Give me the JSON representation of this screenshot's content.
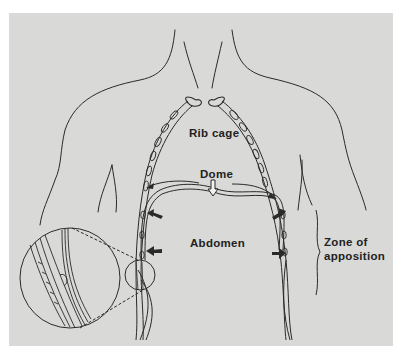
{
  "figure": {
    "background": "#d9d9d7",
    "ink": "#2a2a2a",
    "labels": {
      "rib_cage": "Rib cage",
      "dome": "Dome",
      "abdomen": "Abdomen",
      "zone_line1": "Zone of",
      "zone_line2": "apposition"
    },
    "elements": [
      {
        "name": "torso-outline",
        "description": "neck, shoulders and trunk outline"
      },
      {
        "name": "rib-cage",
        "description": "costal cartilage chains forming rib cage"
      },
      {
        "name": "diaphragm-dome",
        "description": "diaphragm muscle dome with downward hollow arrow"
      },
      {
        "name": "inward-arrows",
        "count": 4,
        "description": "solid arrows pointing toward abdomen / rib cage walls"
      },
      {
        "name": "zone-of-apposition-brace",
        "description": "wavy brace bracket at right"
      },
      {
        "name": "magnified-inset",
        "description": "circle enlargement of left lower rib cage wall with dashed connector lines"
      }
    ]
  }
}
